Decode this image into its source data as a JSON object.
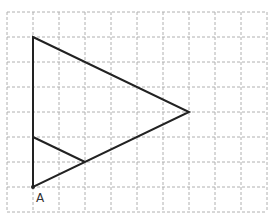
{
  "diagram": {
    "grid": {
      "x0": 7,
      "y0": 12,
      "cols": 10,
      "rows": 8,
      "cell_w": 26,
      "cell_h": 25,
      "line_color": "#b0b0b0",
      "dash": "3,2"
    },
    "stroke_color": "#222222",
    "big_triangle": {
      "points": [
        [
          33,
          37
        ],
        [
          189,
          112
        ],
        [
          33,
          187
        ]
      ]
    },
    "small_triangle": {
      "points": [
        [
          33,
          137
        ],
        [
          85,
          162
        ],
        [
          33,
          187
        ]
      ]
    },
    "point_A": {
      "label": "A",
      "x": 33,
      "y": 187,
      "label_x": 36,
      "label_y": 202
    }
  }
}
